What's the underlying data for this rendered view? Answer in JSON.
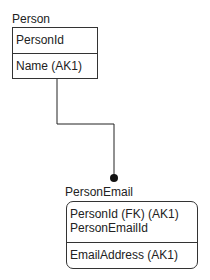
{
  "entities": {
    "person": {
      "name": "Person",
      "keys": [
        "PersonId"
      ],
      "attributes": [
        "Name (AK1)"
      ]
    },
    "person_email": {
      "name": "PersonEmail",
      "keys": [
        "PersonId (FK) (AK1)",
        "PersonEmailId"
      ],
      "attributes": [
        "EmailAddress (AK1)"
      ]
    }
  },
  "relationship": {
    "from": "Person",
    "to": "PersonEmail",
    "type": "identifying one-to-many"
  }
}
